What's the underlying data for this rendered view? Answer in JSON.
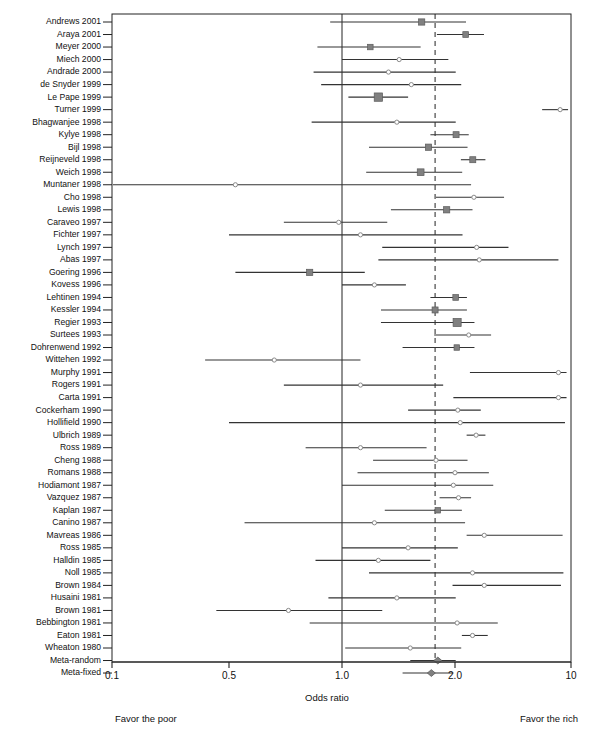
{
  "figure": {
    "type": "forest-plot",
    "xaxis_title": "Odds ratio",
    "footer_left": "Favor the poor",
    "footer_right": "Favor the rich",
    "tick_labels": [
      "0.1",
      "0.5",
      "1.0",
      "2.0",
      "10"
    ],
    "tick_values": [
      0.1,
      0.5,
      1.0,
      2.0,
      10
    ],
    "null_line": 1.0,
    "pooled_line": 1.77,
    "marker_color": "#808080",
    "line_color": "#333333"
  },
  "chart_data": {
    "type": "forest",
    "title": "Odds ratio",
    "xlabel": "Odds ratio",
    "ylabel": "",
    "xlim": [
      0.1,
      10
    ],
    "xscale": "log",
    "grid": false,
    "reference_lines": [
      {
        "value": 1.0,
        "style": "solid"
      },
      {
        "value": 1.77,
        "style": "dashed"
      }
    ],
    "annotations": [
      "Favor the poor",
      "Favor the rich"
    ],
    "categories": [
      "Andrews 2001",
      "Araya 2001",
      "Meyer 2000",
      "Miech 2000",
      "Andrade 2000",
      "de Snyder 1999",
      "Le Pape 1999",
      "Turner 1999",
      "Bhagwanjee 1998",
      "Kylye 1998",
      "Bijl 1998",
      "Reijneveld 1998",
      "Weich 1998",
      "Muntaner 1998",
      "Cho 1998",
      "Lewis 1998",
      "Caraveo 1997",
      "Fichter 1997",
      "Lynch 1997",
      "Abas 1997",
      "Goering 1996",
      "Kovess 1996",
      "Lehtinen 1994",
      "Kessler 1994",
      "Regier 1993",
      "Surtees 1993",
      "Dohrenwend 1992",
      "Wittehen 1992",
      "Murphy 1991",
      "Rogers 1991",
      "Carta 1991",
      "Cockerham 1990",
      "Hollifield 1990",
      "Ulbrich 1989",
      "Ross 1989",
      "Cheng 1988",
      "Romans 1988",
      "Hodiamont 1987",
      "Vazquez 1987",
      "Kaplan 1987",
      "Canino 1987",
      "Mavreas 1986",
      "Ross 1985",
      "Halldin 1985",
      "Noll 1985",
      "Brown 1984",
      "Husaini 1981",
      "Brown 1981",
      "Bebbington 1981",
      "Eaton 1981",
      "Wheaton 1980",
      "Meta-random",
      "Meta-fixed"
    ],
    "studies": [
      {
        "label": "Andrews 2001",
        "or": 1.63,
        "lo": 0.93,
        "hi": 2.33,
        "weight": 0.55,
        "filled": true
      },
      {
        "label": "Araya 2001",
        "or": 2.32,
        "lo": 1.79,
        "hi": 2.99,
        "weight": 0.45,
        "filled": true
      },
      {
        "label": "Meyer 2000",
        "or": 1.19,
        "lo": 0.86,
        "hi": 1.62,
        "weight": 0.4,
        "filled": true
      },
      {
        "label": "Miech 2000",
        "or": 1.42,
        "lo": 1.0,
        "hi": 1.92,
        "weight": 0.22,
        "filled": false
      },
      {
        "label": "Andrade 2000",
        "or": 1.33,
        "lo": 0.84,
        "hi": 2.02,
        "weight": 0.2,
        "filled": false
      },
      {
        "label": "de Snyder 1999",
        "or": 1.53,
        "lo": 0.88,
        "hi": 2.18,
        "weight": 0.18,
        "filled": false
      },
      {
        "label": "Le Pape 1999",
        "or": 1.25,
        "lo": 1.04,
        "hi": 1.5,
        "weight": 0.95,
        "filled": true
      },
      {
        "label": "Turner 1999",
        "or": 8.6,
        "lo": 6.7,
        "hi": 9.6,
        "weight": 0.3,
        "filled": false
      },
      {
        "label": "Bhagwanjee 1998",
        "or": 1.4,
        "lo": 0.83,
        "hi": 2.02,
        "weight": 0.2,
        "filled": false
      },
      {
        "label": "Kylye 1998",
        "or": 2.03,
        "lo": 1.72,
        "hi": 2.42,
        "weight": 0.5,
        "filled": true
      },
      {
        "label": "Bijl 1998",
        "or": 1.7,
        "lo": 1.18,
        "hi": 2.38,
        "weight": 0.55,
        "filled": true
      },
      {
        "label": "Reijneveld 1998",
        "or": 2.56,
        "lo": 2.17,
        "hi": 3.05,
        "weight": 0.5,
        "filled": true
      },
      {
        "label": "Weich 1998",
        "or": 1.62,
        "lo": 1.16,
        "hi": 2.21,
        "weight": 0.65,
        "filled": true
      },
      {
        "label": "Muntaner 1998",
        "or": 0.52,
        "lo": 0.1,
        "hi": 2.5,
        "weight": 0.18,
        "filled": false
      },
      {
        "label": "Cho 1998",
        "or": 2.6,
        "lo": 1.78,
        "hi": 3.95,
        "weight": 0.22,
        "filled": false
      },
      {
        "label": "Lewis 1998",
        "or": 1.9,
        "lo": 1.35,
        "hi": 2.55,
        "weight": 0.55,
        "filled": true
      },
      {
        "label": "Caraveo 1997",
        "or": 0.98,
        "lo": 0.7,
        "hi": 1.32,
        "weight": 0.2,
        "filled": false
      },
      {
        "label": "Fichter 1997",
        "or": 1.12,
        "lo": 0.5,
        "hi": 2.22,
        "weight": 0.18,
        "filled": false
      },
      {
        "label": "Lynch 1997",
        "or": 2.7,
        "lo": 1.28,
        "hi": 4.2,
        "weight": 0.2,
        "filled": false
      },
      {
        "label": "Abas 1997",
        "or": 2.8,
        "lo": 1.25,
        "hi": 8.4,
        "weight": 0.18,
        "filled": false
      },
      {
        "label": "Goering 1996",
        "or": 0.82,
        "lo": 0.52,
        "hi": 1.15,
        "weight": 0.55,
        "filled": true
      },
      {
        "label": "Kovess 1996",
        "or": 1.22,
        "lo": 1.0,
        "hi": 1.48,
        "weight": 0.22,
        "filled": false
      },
      {
        "label": "Lehtinen 1994",
        "or": 2.02,
        "lo": 1.72,
        "hi": 2.36,
        "weight": 0.45,
        "filled": true
      },
      {
        "label": "Kessler 1994",
        "or": 1.77,
        "lo": 1.27,
        "hi": 2.36,
        "weight": 0.5,
        "filled": true
      },
      {
        "label": "Regier 1993",
        "or": 2.06,
        "lo": 1.27,
        "hi": 2.62,
        "weight": 0.9,
        "filled": true
      },
      {
        "label": "Surtees 1993",
        "or": 2.42,
        "lo": 1.76,
        "hi": 3.3,
        "weight": 0.22,
        "filled": false
      },
      {
        "label": "Dohrenwend 1992",
        "or": 2.05,
        "lo": 1.45,
        "hi": 2.62,
        "weight": 0.4,
        "filled": true
      },
      {
        "label": "Wittehen 1992",
        "or": 0.66,
        "lo": 0.36,
        "hi": 1.12,
        "weight": 0.22,
        "filled": false
      },
      {
        "label": "Murphy 1991",
        "or": 8.4,
        "lo": 2.46,
        "hi": 9.4,
        "weight": 0.2,
        "filled": false
      },
      {
        "label": "Rogers 1991",
        "or": 1.12,
        "lo": 0.7,
        "hi": 1.86,
        "weight": 0.22,
        "filled": false
      },
      {
        "label": "Carta 1991",
        "or": 8.4,
        "lo": 1.98,
        "hi": 9.4,
        "weight": 0.2,
        "filled": false
      },
      {
        "label": "Cockerham 1990",
        "or": 2.08,
        "lo": 1.5,
        "hi": 2.86,
        "weight": 0.25,
        "filled": false
      },
      {
        "label": "Hollifield 1990",
        "or": 2.15,
        "lo": 0.5,
        "hi": 9.2,
        "weight": 0.22,
        "filled": false
      },
      {
        "label": "Ulbrich 1989",
        "or": 2.68,
        "lo": 2.35,
        "hi": 3.05,
        "weight": 0.25,
        "filled": false
      },
      {
        "label": "Ross 1989",
        "or": 1.12,
        "lo": 0.8,
        "hi": 1.68,
        "weight": 0.22,
        "filled": false
      },
      {
        "label": "Cheng 1988",
        "or": 1.78,
        "lo": 1.21,
        "hi": 2.38,
        "weight": 0.22,
        "filled": false
      },
      {
        "label": "Romans 1988",
        "or": 2.0,
        "lo": 1.1,
        "hi": 3.2,
        "weight": 0.22,
        "filled": false
      },
      {
        "label": "Hodiamont 1987",
        "or": 1.98,
        "lo": 1.0,
        "hi": 3.4,
        "weight": 0.22,
        "filled": false
      },
      {
        "label": "Vazquez 1987",
        "or": 2.1,
        "lo": 1.82,
        "hi": 2.5,
        "weight": 0.25,
        "filled": false
      },
      {
        "label": "Kaplan 1987",
        "or": 1.8,
        "lo": 1.3,
        "hi": 2.2,
        "weight": 0.4,
        "filled": true
      },
      {
        "label": "Canino 1987",
        "or": 1.22,
        "lo": 0.55,
        "hi": 2.3,
        "weight": 0.22,
        "filled": false
      },
      {
        "label": "Mavreas 1986",
        "or": 3.0,
        "lo": 2.35,
        "hi": 8.9,
        "weight": 0.22,
        "filled": false
      },
      {
        "label": "Ross 1985",
        "or": 1.5,
        "lo": 1.0,
        "hi": 2.08,
        "weight": 0.22,
        "filled": false
      },
      {
        "label": "Halldin 1985",
        "or": 1.25,
        "lo": 0.85,
        "hi": 1.72,
        "weight": 0.22,
        "filled": false
      },
      {
        "label": "Noll 1985",
        "or": 2.55,
        "lo": 1.18,
        "hi": 9.0,
        "weight": 0.22,
        "filled": false
      },
      {
        "label": "Brown 1984",
        "or": 3.0,
        "lo": 1.97,
        "hi": 8.7,
        "weight": 0.22,
        "filled": false
      },
      {
        "label": "Husaini 1981",
        "or": 1.4,
        "lo": 0.92,
        "hi": 2.02,
        "weight": 0.22,
        "filled": false
      },
      {
        "label": "Brown 1981",
        "or": 0.72,
        "lo": 0.42,
        "hi": 1.28,
        "weight": 0.22,
        "filled": false
      },
      {
        "label": "Bebbington 1981",
        "or": 2.06,
        "lo": 0.82,
        "hi": 3.62,
        "weight": 0.22,
        "filled": false
      },
      {
        "label": "Eaton 1981",
        "or": 2.55,
        "lo": 2.2,
        "hi": 3.15,
        "weight": 0.22,
        "filled": false
      },
      {
        "label": "Wheaton 1980",
        "or": 1.52,
        "lo": 1.02,
        "hi": 2.18,
        "weight": 0.22,
        "filled": false
      },
      {
        "label": "Meta-random",
        "or": 1.8,
        "lo": 1.52,
        "hi": 2.02,
        "weight": 0.6,
        "filled": true,
        "diamond": true
      },
      {
        "label": "Meta-fixed",
        "or": 1.73,
        "lo": 1.45,
        "hi": 1.98,
        "weight": 0.7,
        "filled": true,
        "diamond": true
      }
    ]
  }
}
